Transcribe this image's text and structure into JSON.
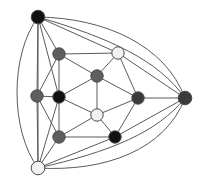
{
  "figure": {
    "background": "#ffffff",
    "width": 203,
    "height": 188
  },
  "palette": {
    "black": "#111111",
    "dark_gray": "#3b3b3b",
    "mid_gray": "#5e5e5e",
    "white": "#f2f2f2",
    "edge_stroke": "#5a5a5a",
    "node_stroke": "#4a4a4a"
  },
  "graph": {
    "node_radius": 6.2,
    "outer_node_radius": 6.6,
    "nodes": [
      {
        "id": "o-top",
        "label": "outer-top-left",
        "x": 38,
        "y": 17,
        "fill": "#111111",
        "r": 6.8,
        "ring": "outer"
      },
      {
        "id": "o-bottom",
        "label": "outer-bottom-left",
        "x": 38,
        "y": 168,
        "fill": "#f2f2f2",
        "r": 6.8,
        "ring": "outer"
      },
      {
        "id": "o-right",
        "label": "outer-right",
        "x": 185,
        "y": 98,
        "fill": "#3b3b3b",
        "r": 6.8,
        "ring": "outer"
      },
      {
        "id": "m-tl",
        "label": "mid-top-left",
        "x": 59,
        "y": 54,
        "fill": "#5e5e5e",
        "r": 6.2,
        "ring": "middle"
      },
      {
        "id": "m-tr",
        "label": "mid-top-right",
        "x": 118,
        "y": 53,
        "fill": "#f2f2f2",
        "r": 6.2,
        "ring": "middle"
      },
      {
        "id": "m-left",
        "label": "mid-left",
        "x": 37,
        "y": 96,
        "fill": "#5e5e5e",
        "r": 6.2,
        "ring": "middle"
      },
      {
        "id": "m-right",
        "label": "mid-right",
        "x": 138,
        "y": 98,
        "fill": "#3b3b3b",
        "r": 6.2,
        "ring": "middle"
      },
      {
        "id": "m-bl",
        "label": "mid-bottom-left",
        "x": 59,
        "y": 137,
        "fill": "#5e5e5e",
        "r": 6.2,
        "ring": "middle"
      },
      {
        "id": "m-br",
        "label": "mid-bottom-right",
        "x": 115,
        "y": 137,
        "fill": "#111111",
        "r": 6.2,
        "ring": "middle"
      },
      {
        "id": "i-top",
        "label": "inner-top",
        "x": 97,
        "y": 76,
        "fill": "#5e5e5e",
        "r": 6.2,
        "ring": "inner"
      },
      {
        "id": "i-left",
        "label": "inner-left",
        "x": 59,
        "y": 97,
        "fill": "#111111",
        "r": 6.2,
        "ring": "inner"
      },
      {
        "id": "i-bottom",
        "label": "inner-bottom",
        "x": 97,
        "y": 115,
        "fill": "#f2f2f2",
        "r": 6.2,
        "ring": "inner"
      }
    ],
    "edges": [
      {
        "from": "o-top",
        "to": "m-tl"
      },
      {
        "from": "o-top",
        "to": "m-tr"
      },
      {
        "from": "o-top",
        "to": "m-left"
      },
      {
        "from": "o-top",
        "to": "i-left"
      },
      {
        "from": "o-bottom",
        "to": "m-bl"
      },
      {
        "from": "o-bottom",
        "to": "m-br"
      },
      {
        "from": "o-bottom",
        "to": "m-left"
      },
      {
        "from": "o-bottom",
        "to": "i-left"
      },
      {
        "from": "o-right",
        "to": "m-tr"
      },
      {
        "from": "o-right",
        "to": "m-right"
      },
      {
        "from": "o-right",
        "to": "m-br"
      },
      {
        "from": "m-tl",
        "to": "m-tr"
      },
      {
        "from": "m-tl",
        "to": "m-left"
      },
      {
        "from": "m-tl",
        "to": "i-left"
      },
      {
        "from": "m-tl",
        "to": "i-top"
      },
      {
        "from": "m-tr",
        "to": "i-top"
      },
      {
        "from": "m-tr",
        "to": "m-right"
      },
      {
        "from": "m-left",
        "to": "i-left"
      },
      {
        "from": "m-left",
        "to": "m-bl"
      },
      {
        "from": "m-right",
        "to": "i-top"
      },
      {
        "from": "m-right",
        "to": "i-bottom"
      },
      {
        "from": "m-right",
        "to": "m-br"
      },
      {
        "from": "m-bl",
        "to": "i-left"
      },
      {
        "from": "m-bl",
        "to": "i-bottom"
      },
      {
        "from": "m-bl",
        "to": "m-br"
      },
      {
        "from": "m-br",
        "to": "i-bottom"
      },
      {
        "from": "i-top",
        "to": "i-left"
      },
      {
        "from": "i-top",
        "to": "i-bottom"
      },
      {
        "from": "i-left",
        "to": "i-bottom"
      }
    ],
    "arcs": [
      {
        "id": "arc-left",
        "label": "left-outer-arc",
        "d": "M 38 17 C 10 55, 10 130, 38 168"
      },
      {
        "id": "arc-left-straight",
        "label": "left-straight-chord",
        "d": "M 38 17 L 38 168"
      },
      {
        "id": "arc-top-right",
        "label": "top-right-outer-arc",
        "d": "M 38 17 C 105 18, 165 45, 185 98"
      },
      {
        "id": "arc-bottom-right",
        "label": "bottom-right-outer-arc",
        "d": "M 38 168 C 105 172, 165 150, 185 98"
      },
      {
        "id": "arc-top-inner",
        "label": "top-right-inner-chord",
        "d": "M 38 17 C 110 38, 158 60, 185 98"
      },
      {
        "id": "arc-bottom-inner",
        "label": "bottom-right-inner-chord",
        "d": "M 38 168 C 110 152, 158 132, 185 98"
      }
    ]
  }
}
